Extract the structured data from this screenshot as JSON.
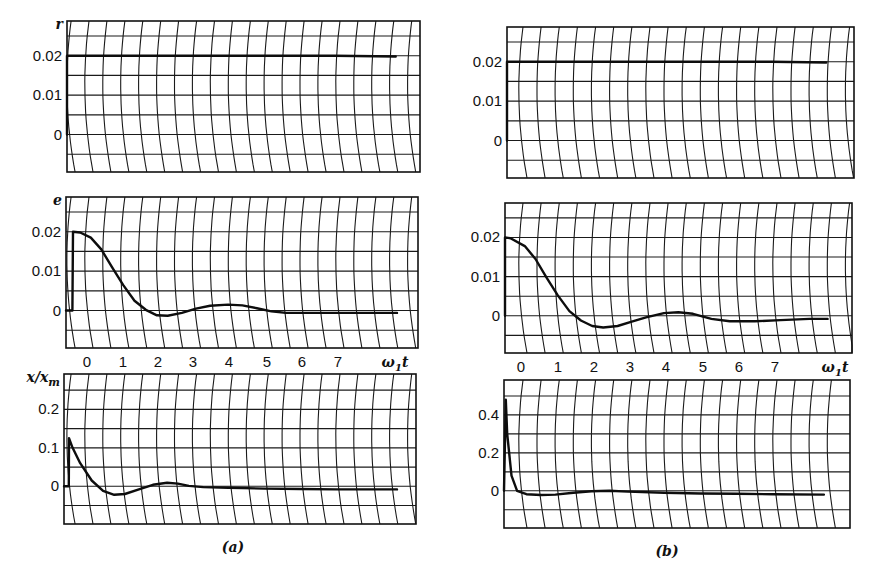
{
  "figure": {
    "columns": [
      {
        "id": "a",
        "caption": "(a)",
        "caption_pos": [
          233,
          552
        ],
        "x_tick_labels": [
          "0",
          "1",
          "2",
          "3",
          "4",
          "5",
          "6",
          "7"
        ],
        "x_tick_px": [
          87,
          123,
          158,
          193,
          229,
          267,
          302,
          338
        ],
        "x_axis_label": "ω₁t",
        "x_axis_label_px": [
          395,
          366
        ],
        "panels": [
          {
            "id": "a-r",
            "axis_name": "r",
            "box": {
              "left": 67,
              "top": 21,
              "right": 420,
              "bottom": 172
            },
            "y_ticks": [
              {
                "label": "0.02",
                "value": 0.02
              },
              {
                "label": "0.01",
                "value": 0.01
              },
              {
                "label": "0",
                "value": 0
              }
            ],
            "y_range": [
              -0.0095,
              0.0288
            ],
            "h_lines": 8
          },
          {
            "id": "a-e",
            "axis_name": "e",
            "box": {
              "left": 66,
              "top": 197,
              "right": 418,
              "bottom": 348
            },
            "y_ticks": [
              {
                "label": "0.02",
                "value": 0.02
              },
              {
                "label": "0.01",
                "value": 0.01
              },
              {
                "label": "0",
                "value": 0
              }
            ],
            "y_range": [
              -0.0095,
              0.0288
            ],
            "h_lines": 8
          },
          {
            "id": "a-x",
            "axis_name": "x/x_m",
            "box": {
              "left": 64,
              "top": 374,
              "right": 416,
              "bottom": 524
            },
            "y_ticks": [
              {
                "label": "0.2",
                "value": 0.2
              },
              {
                "label": "0.1",
                "value": 0.1
              },
              {
                "label": "0",
                "value": 0
              }
            ],
            "y_range": [
              -0.098,
              0.292
            ],
            "h_lines": 8
          }
        ]
      },
      {
        "id": "b",
        "caption": "(b)",
        "caption_pos": [
          667,
          556
        ],
        "x_tick_labels": [
          "0",
          "1",
          "2",
          "3",
          "4",
          "5",
          "6",
          "7"
        ],
        "x_tick_px": [
          521,
          558,
          594,
          630,
          666,
          703,
          739,
          775
        ],
        "x_axis_label": "ω₁t",
        "x_axis_label_px": [
          835,
          371
        ],
        "panels": [
          {
            "id": "b-r",
            "axis_name": "",
            "box": {
              "left": 507,
              "top": 27,
              "right": 854,
              "bottom": 178
            },
            "y_ticks": [
              {
                "label": "0.02",
                "value": 0.02
              },
              {
                "label": "0.01",
                "value": 0.01
              },
              {
                "label": "0",
                "value": 0
              }
            ],
            "y_range": [
              -0.0095,
              0.0288
            ],
            "h_lines": 8
          },
          {
            "id": "b-e",
            "axis_name": "",
            "box": {
              "left": 505,
              "top": 203,
              "right": 852,
              "bottom": 353
            },
            "y_ticks": [
              {
                "label": "0.02",
                "value": 0.02
              },
              {
                "label": "0.01",
                "value": 0.01
              },
              {
                "label": "0",
                "value": 0
              }
            ],
            "y_range": [
              -0.0095,
              0.0288
            ],
            "h_lines": 8
          },
          {
            "id": "b-x",
            "axis_name": "",
            "box": {
              "left": 504,
              "top": 380,
              "right": 850,
              "bottom": 528
            },
            "y_ticks": [
              {
                "label": "0.4",
                "value": 0.4
              },
              {
                "label": "0.2",
                "value": 0.2
              },
              {
                "label": "0",
                "value": 0
              }
            ],
            "y_range": [
              -0.196,
              0.584
            ],
            "h_lines": 8
          }
        ]
      }
    ]
  },
  "chart_data": [
    {
      "type": "line",
      "title": "(a) r — reference step input",
      "xlabel": "ω₁t",
      "ylabel": "r",
      "x_ticks": [
        0,
        1,
        2,
        3,
        4,
        5,
        6,
        7
      ],
      "y_ticks": [
        "0",
        "0.01",
        "0.02"
      ],
      "grid": true,
      "series": [
        {
          "name": "r",
          "x": [
            -0.6,
            -0.55,
            -0.55,
            0,
            1,
            2,
            3,
            4,
            5,
            6,
            7,
            8.7
          ],
          "y": [
            0,
            0,
            0.02,
            0.02,
            0.02,
            0.02,
            0.02,
            0.02,
            0.02,
            0.02,
            0.02,
            0.0198
          ]
        }
      ]
    },
    {
      "type": "line",
      "title": "(a) e — error",
      "xlabel": "ω₁t",
      "ylabel": "e",
      "x_ticks": [
        0,
        1,
        2,
        3,
        4,
        5,
        6,
        7
      ],
      "y_ticks": [
        "0",
        "0.01",
        "0.02"
      ],
      "grid": true,
      "series": [
        {
          "name": "e",
          "x": [
            -0.6,
            -0.35,
            -0.3,
            -0.1,
            0.2,
            0.5,
            0.8,
            1.1,
            1.4,
            1.7,
            2.0,
            2.3,
            2.7,
            3.1,
            3.5,
            4.0,
            4.4,
            4.8,
            5.2,
            5.6,
            6.0,
            7.0,
            8.7
          ],
          "y": [
            0,
            0,
            0.02,
            0.0198,
            0.0185,
            0.0155,
            0.011,
            0.0065,
            0.0025,
            0.0002,
            -0.0012,
            -0.0013,
            -0.0006,
            0.0005,
            0.0012,
            0.0015,
            0.0013,
            0.0006,
            -0.0002,
            -0.0006,
            -0.0006,
            -0.0006,
            -0.0006
          ]
        }
      ]
    },
    {
      "type": "line",
      "title": "(a) x/x_m — normalized output",
      "xlabel": "ω₁t",
      "ylabel": "x/x_m",
      "x_ticks": [
        0,
        1,
        2,
        3,
        4,
        5,
        6,
        7
      ],
      "y_ticks": [
        "0",
        "0.1",
        "0.2"
      ],
      "grid": true,
      "series": [
        {
          "name": "x/x_m",
          "x": [
            -0.6,
            -0.45,
            -0.4,
            -0.3,
            -0.1,
            0.2,
            0.5,
            0.8,
            1.1,
            1.5,
            1.9,
            2.3,
            2.6,
            2.9,
            3.3,
            4.0,
            5.0,
            6.0,
            7.0,
            8.7
          ],
          "y": [
            0,
            0,
            0.125,
            0.1,
            0.06,
            0.015,
            -0.012,
            -0.022,
            -0.02,
            -0.008,
            0.004,
            0.009,
            0.007,
            0.001,
            -0.002,
            -0.004,
            -0.006,
            -0.007,
            -0.008,
            -0.008
          ]
        }
      ]
    },
    {
      "type": "line",
      "title": "(b) r — reference step input",
      "xlabel": "ω₁t",
      "ylabel": "r",
      "x_ticks": [
        0,
        1,
        2,
        3,
        4,
        5,
        6,
        7
      ],
      "y_ticks": [
        "0",
        "0.01",
        "0.02"
      ],
      "grid": true,
      "series": [
        {
          "name": "r",
          "x": [
            -0.6,
            -0.5,
            -0.5,
            0,
            1,
            2,
            3,
            4,
            5,
            6,
            7,
            8.5
          ],
          "y": [
            0,
            0,
            0.02,
            0.02,
            0.02,
            0.02,
            0.02,
            0.02,
            0.02,
            0.02,
            0.02,
            0.0198
          ]
        }
      ]
    },
    {
      "type": "line",
      "title": "(b) e — error",
      "xlabel": "ω₁t",
      "ylabel": "",
      "x_ticks": [
        0,
        1,
        2,
        3,
        4,
        5,
        6,
        7
      ],
      "y_ticks": [
        "0",
        "0.01",
        "0.02"
      ],
      "grid": true,
      "series": [
        {
          "name": "e",
          "x": [
            -0.6,
            -0.45,
            -0.4,
            -0.2,
            0.2,
            0.5,
            0.8,
            1.1,
            1.4,
            1.7,
            2.0,
            2.3,
            2.7,
            3.1,
            3.5,
            4.0,
            4.4,
            4.8,
            5.3,
            5.8,
            6.5,
            7.2,
            8.0,
            8.5
          ],
          "y": [
            0,
            0,
            0.02,
            0.0198,
            0.0178,
            0.0145,
            0.0098,
            0.0052,
            0.0012,
            -0.0012,
            -0.0026,
            -0.003,
            -0.0026,
            -0.0015,
            -0.0004,
            0.0007,
            0.0009,
            0.0005,
            -0.0008,
            -0.0014,
            -0.0014,
            -0.0011,
            -0.0008,
            -0.0008
          ]
        }
      ]
    },
    {
      "type": "line",
      "title": "(b) x/x_m — normalized output",
      "xlabel": "ω₁t",
      "ylabel": "",
      "x_ticks": [
        0,
        1,
        2,
        3,
        4,
        5,
        6,
        7
      ],
      "y_ticks": [
        "0",
        "0.2",
        "0.4"
      ],
      "grid": true,
      "series": [
        {
          "name": "x/x_m",
          "x": [
            -0.6,
            -0.45,
            -0.35,
            -0.28,
            -0.18,
            -0.05,
            0.2,
            0.6,
            1.0,
            1.5,
            2.0,
            2.5,
            3.0,
            4.0,
            5.0,
            6.0,
            7.0,
            8.4
          ],
          "y": [
            0,
            0,
            0.48,
            0.3,
            0.08,
            0.0,
            -0.018,
            -0.022,
            -0.02,
            -0.01,
            -0.002,
            0.0,
            -0.004,
            -0.01,
            -0.014,
            -0.016,
            -0.018,
            -0.02
          ]
        }
      ]
    }
  ]
}
